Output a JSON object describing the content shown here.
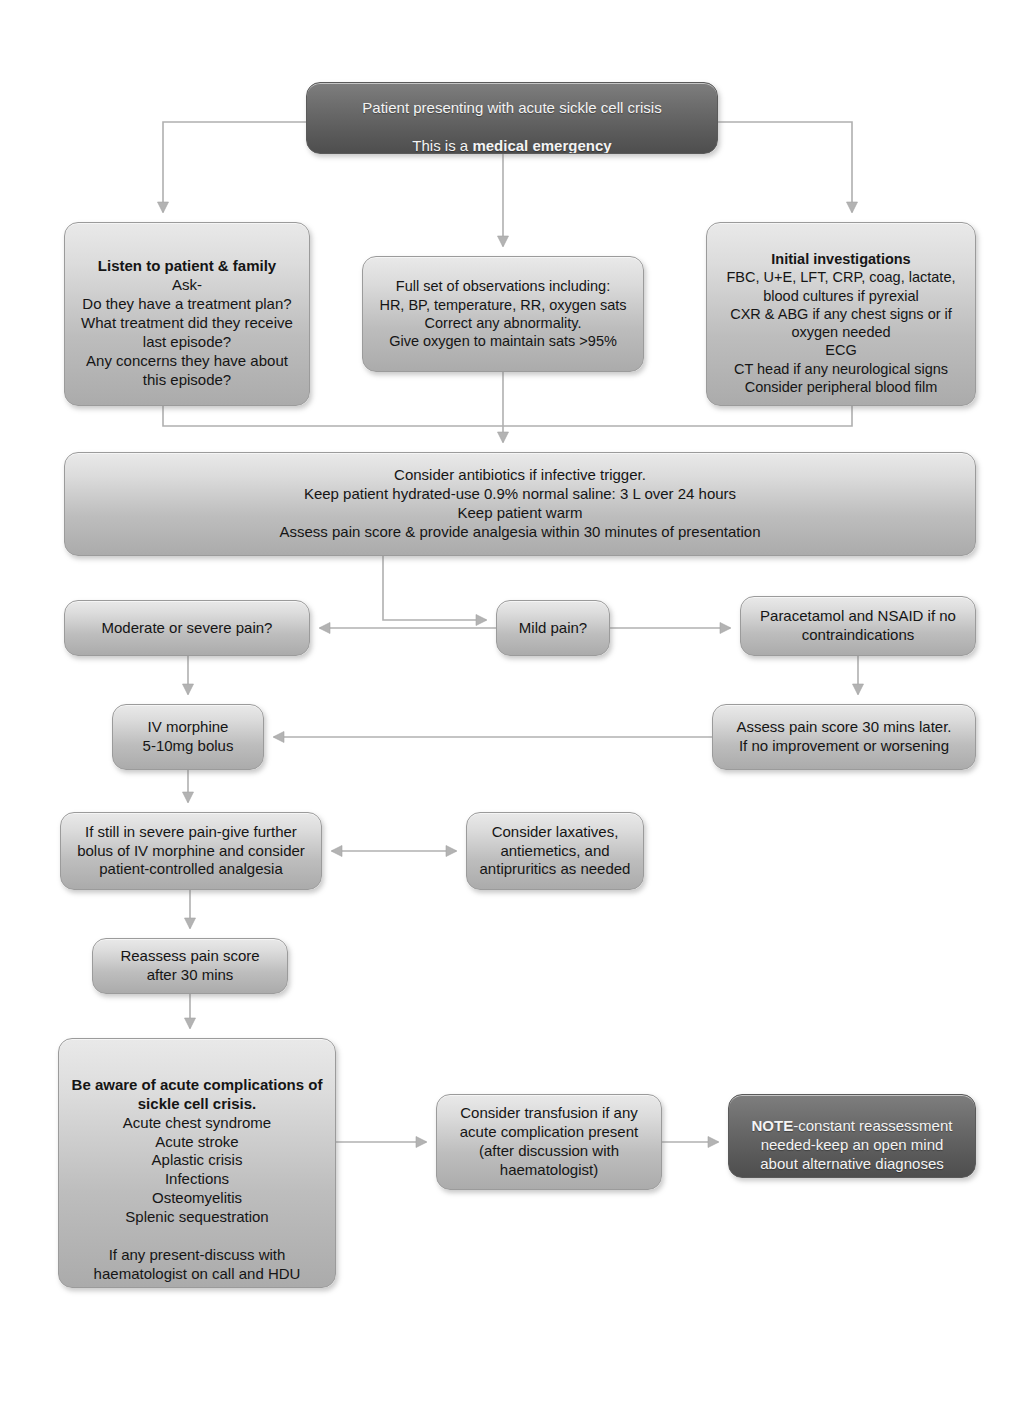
{
  "theme": {
    "dark_box": "#5f5f5f",
    "light_box": "#c8c8c8",
    "edge": "#a9a9a9",
    "text_dark": "#151515",
    "text_light": "#f4f4f4",
    "page_background": "#ffffff"
  },
  "nodes": {
    "presentation": {
      "name": "presentation-box",
      "style": "dark",
      "line1": "Patient presenting with acute sickle cell crisis",
      "line2_prefix": "This is a ",
      "line2_bold": "medical emergency",
      "x": 306,
      "y": 82,
      "w": 412,
      "h": 72
    },
    "listen": {
      "name": "listen-to-patient-box",
      "style": "light",
      "heading": "Listen to patient & family",
      "body": "Ask-\nDo they have a treatment plan?\nWhat treatment did they receive last episode?\nAny concerns they have about this episode?",
      "x": 64,
      "y": 222,
      "w": 246,
      "h": 184
    },
    "observations": {
      "name": "observations-box",
      "style": "light",
      "heading": "",
      "body": "Full set of observations including:\nHR, BP, temperature, RR, oxygen sats\nCorrect any abnormality.\nGive oxygen to maintain sats >95%",
      "x": 362,
      "y": 256,
      "w": 282,
      "h": 116
    },
    "investigations": {
      "name": "initial-investigations-box",
      "style": "light",
      "heading": "Initial investigations",
      "body": "FBC, U+E, LFT, CRP, coag, lactate, blood cultures if pyrexial\nCXR & ABG if any chest signs or if oxygen needed\nECG\nCT head if any neurological signs\nConsider peripheral blood film",
      "x": 706,
      "y": 222,
      "w": 270,
      "h": 184
    },
    "supportive": {
      "name": "supportive-care-box",
      "style": "light",
      "heading": "",
      "body": "Consider antibiotics if infective trigger.\nKeep patient hydrated-use 0.9% normal saline: 3 L over 24 hours\nKeep patient warm\nAssess pain score & provide analgesia within 30 minutes of presentation",
      "x": 64,
      "y": 452,
      "w": 912,
      "h": 104
    },
    "moderate_severe": {
      "name": "moderate-or-severe-pain-box",
      "style": "light",
      "heading": "",
      "body": "Moderate or severe pain?",
      "x": 64,
      "y": 600,
      "w": 246,
      "h": 56
    },
    "mild": {
      "name": "mild-pain-box",
      "style": "light",
      "heading": "",
      "body": "Mild pain?",
      "x": 496,
      "y": 600,
      "w": 114,
      "h": 56
    },
    "paracetamol": {
      "name": "paracetamol-nsaid-box",
      "style": "light",
      "heading": "",
      "body": "Paracetamol and NSAID if no contraindications",
      "x": 740,
      "y": 596,
      "w": 236,
      "h": 60
    },
    "morphine": {
      "name": "iv-morphine-box",
      "style": "light",
      "heading": "",
      "body": "IV morphine\n5-10mg bolus",
      "x": 112,
      "y": 704,
      "w": 152,
      "h": 66
    },
    "reassess_30": {
      "name": "assess-pain-30-mins-box",
      "style": "light",
      "heading": "",
      "body": "Assess pain score 30 mins later.\nIf no improvement or worsening",
      "x": 712,
      "y": 704,
      "w": 264,
      "h": 66
    },
    "further_bolus": {
      "name": "further-bolus-pca-box",
      "style": "light",
      "heading": "",
      "body": "If still in severe pain-give further bolus of IV morphine and consider patient-controlled analgesia",
      "x": 60,
      "y": 812,
      "w": 262,
      "h": 78
    },
    "laxatives": {
      "name": "laxatives-antiemetics-box",
      "style": "light",
      "heading": "",
      "body": "Consider laxatives, antiemetics, and antipruritics as needed",
      "x": 466,
      "y": 812,
      "w": 178,
      "h": 78
    },
    "reassess_score": {
      "name": "reassess-pain-score-box",
      "style": "light",
      "heading": "",
      "body": "Reassess pain score\nafter 30 mins",
      "x": 92,
      "y": 938,
      "w": 196,
      "h": 56
    },
    "complications": {
      "name": "acute-complications-box",
      "style": "light",
      "heading": "Be aware of acute complications of sickle cell crisis.",
      "body": "Acute chest syndrome\nAcute stroke\nAplastic crisis\nInfections\nOsteomyelitis\nSplenic sequestration\n\nIf any present-discuss with haematologist on call and HDU",
      "x": 58,
      "y": 1038,
      "w": 278,
      "h": 250
    },
    "transfusion": {
      "name": "consider-transfusion-box",
      "style": "light",
      "heading": "",
      "body": "Consider transfusion if any acute complication present (after discussion with haematologist)",
      "x": 436,
      "y": 1094,
      "w": 226,
      "h": 96
    },
    "note": {
      "name": "note-box",
      "style": "dark",
      "heading": "",
      "bold_prefix": "NOTE",
      "body": "-constant reassessment needed-keep an open mind about alternative diagnoses",
      "x": 728,
      "y": 1094,
      "w": 248,
      "h": 84
    }
  },
  "edges": [
    {
      "name": "edge-presentation-to-listen",
      "type": "elbow-down-left",
      "arrow": "down"
    },
    {
      "name": "edge-presentation-to-observations",
      "type": "straight-down",
      "arrow": "down"
    },
    {
      "name": "edge-presentation-to-investigations",
      "type": "elbow-down-right",
      "arrow": "down"
    },
    {
      "name": "edge-assessment-merge-to-supportive",
      "type": "merge-down",
      "arrow": "down"
    },
    {
      "name": "edge-supportive-to-mild-pain",
      "type": "branch-down",
      "arrow": "down"
    },
    {
      "name": "edge-mild-to-moderate",
      "type": "horizontal-left",
      "arrow": "left"
    },
    {
      "name": "edge-mild-to-paracetamol",
      "type": "horizontal-right",
      "arrow": "right"
    },
    {
      "name": "edge-moderate-to-morphine",
      "type": "straight-down",
      "arrow": "down"
    },
    {
      "name": "edge-paracetamol-to-reassess30",
      "type": "straight-down",
      "arrow": "down"
    },
    {
      "name": "edge-reassess30-to-morphine",
      "type": "horizontal-left",
      "arrow": "left"
    },
    {
      "name": "edge-morphine-to-further-bolus",
      "type": "straight-down",
      "arrow": "down"
    },
    {
      "name": "edge-laxatives-further-bolus",
      "type": "horizontal-bidirectional",
      "arrow": "both"
    },
    {
      "name": "edge-further-bolus-to-reassess-score",
      "type": "straight-down",
      "arrow": "down"
    },
    {
      "name": "edge-reassess-score-to-complications",
      "type": "straight-down",
      "arrow": "down"
    },
    {
      "name": "edge-complications-to-transfusion",
      "type": "horizontal-right",
      "arrow": "right"
    },
    {
      "name": "edge-transfusion-to-note",
      "type": "horizontal-right",
      "arrow": "right"
    }
  ]
}
